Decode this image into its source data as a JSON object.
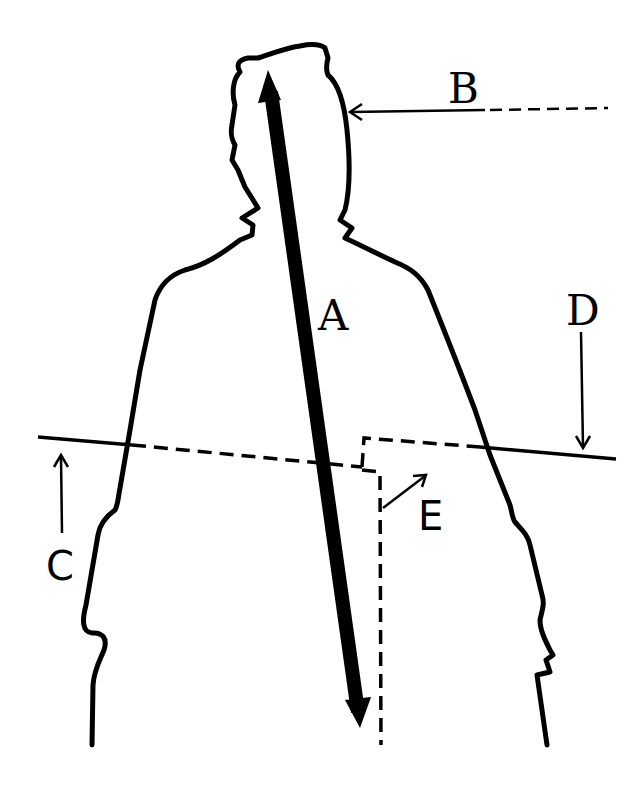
{
  "diagram": {
    "title": "",
    "background": "#ffffff",
    "stroke_color": "#000000",
    "labels": {
      "A": "A",
      "B": "B",
      "C": "C",
      "D": "D",
      "E": "E"
    },
    "elements": [
      {
        "id": "A",
        "type": "double-headed thick arrow",
        "description": "Long axis arrow from top of head to bottom of torso"
      },
      {
        "id": "B",
        "type": "arrow with dashed tail",
        "description": "Horizontal arrow pointing left at right side of head"
      },
      {
        "id": "C",
        "type": "upward arrow",
        "description": "Arrow pointing up to left end of horizontal cutting line"
      },
      {
        "id": "D",
        "type": "downward arrow",
        "description": "Arrow pointing down to right end of horizontal cutting line"
      },
      {
        "id": "E",
        "type": "diagonal arrow",
        "description": "Arrow pointing up-right from stepped dashed line"
      }
    ],
    "figure": "Silhouette outline of a human head and upper body"
  }
}
